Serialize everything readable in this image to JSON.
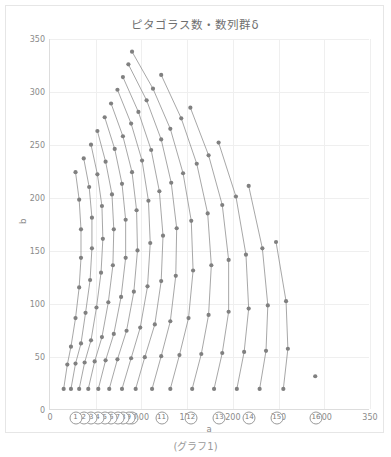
{
  "caption": "(グラフ1)",
  "chart_data": {
    "type": "line",
    "title": "ピタゴラス数・数列群δ",
    "xlabel": "a",
    "ylabel": "b",
    "xlim": [
      0,
      350
    ],
    "ylim": [
      0,
      350
    ],
    "xticks": [
      0,
      50,
      100,
      150,
      200,
      250,
      300,
      350
    ],
    "yticks": [
      0,
      50,
      100,
      150,
      200,
      250,
      300,
      350
    ],
    "grid": true,
    "legend": "none",
    "marker": "circle",
    "marker_color": "#808080",
    "line_color": "#909090",
    "series": [
      {
        "name": "①",
        "label_x": 6,
        "label_y": -13,
        "points": [
          [
            4,
            3
          ],
          [
            5,
            12
          ],
          [
            8,
            15
          ],
          [
            7,
            24
          ],
          [
            12,
            35
          ],
          [
            9,
            40
          ],
          [
            20,
            21
          ],
          [
            12,
            16
          ]
        ]
      },
      {
        "name": "②",
        "label_x": 15,
        "label_y": -13,
        "points": [
          [
            8,
            6
          ],
          [
            10,
            24
          ],
          [
            16,
            30
          ],
          [
            14,
            48
          ],
          [
            24,
            70
          ],
          [
            18,
            80
          ],
          [
            40,
            42
          ],
          [
            24,
            32
          ]
        ]
      },
      {
        "name": "③",
        "label_x": 25,
        "label_y": -13,
        "points": [
          [
            12,
            9
          ],
          [
            15,
            36
          ],
          [
            24,
            45
          ],
          [
            21,
            72
          ],
          [
            36,
            105
          ],
          [
            27,
            120
          ],
          [
            60,
            63
          ],
          [
            36,
            48
          ]
        ]
      },
      {
        "name": "④",
        "label_x": 37,
        "label_y": -13,
        "points": [
          [
            16,
            12
          ],
          [
            20,
            48
          ],
          [
            32,
            60
          ],
          [
            28,
            96
          ],
          [
            48,
            140
          ],
          [
            36,
            160
          ],
          [
            80,
            84
          ],
          [
            48,
            64
          ]
        ]
      },
      {
        "name": "⑤",
        "label_x": 49,
        "label_y": -13,
        "points": [
          [
            20,
            15
          ],
          [
            25,
            60
          ],
          [
            40,
            75
          ],
          [
            35,
            120
          ],
          [
            60,
            175
          ],
          [
            45,
            200
          ],
          [
            100,
            105
          ],
          [
            60,
            80
          ]
        ]
      },
      {
        "name": "⑥",
        "label_x": 64,
        "label_y": -13,
        "points": [
          [
            24,
            18
          ],
          [
            30,
            72
          ],
          [
            48,
            90
          ],
          [
            42,
            144
          ],
          [
            72,
            210
          ],
          [
            54,
            240
          ],
          [
            120,
            126
          ],
          [
            72,
            96
          ]
        ]
      },
      {
        "name": "⑦",
        "label_x": 80,
        "label_y": -13,
        "points": [
          [
            28,
            21
          ],
          [
            35,
            84
          ],
          [
            56,
            105
          ],
          [
            49,
            168
          ],
          [
            84,
            245
          ],
          [
            63,
            280
          ],
          [
            140,
            147
          ],
          [
            84,
            112
          ]
        ]
      },
      {
        "name": "⑧",
        "label_x": 97,
        "label_y": -13,
        "points": [
          [
            32,
            24
          ],
          [
            40,
            96
          ],
          [
            64,
            120
          ],
          [
            56,
            192
          ],
          [
            96,
            280
          ],
          [
            72,
            320
          ],
          [
            160,
            168
          ],
          [
            96,
            128
          ]
        ]
      },
      {
        "name": "⑨",
        "label_x": 116,
        "label_y": -13,
        "points": [
          [
            36,
            27
          ],
          [
            45,
            108
          ],
          [
            72,
            135
          ],
          [
            63,
            216
          ],
          [
            108,
            315
          ],
          [
            81,
            360
          ],
          [
            180,
            189
          ],
          [
            108,
            144
          ]
        ]
      },
      {
        "name": "⑩",
        "label_x": 136,
        "label_y": -13,
        "points": [
          [
            40,
            30
          ],
          [
            50,
            120
          ],
          [
            80,
            150
          ],
          [
            70,
            240
          ],
          [
            120,
            350
          ],
          [
            200,
            210
          ],
          [
            120,
            160
          ]
        ]
      },
      {
        "name": "⑪",
        "label_x": 156,
        "label_y": -13,
        "points": [
          [
            44,
            33
          ],
          [
            55,
            132
          ],
          [
            88,
            165
          ],
          [
            77,
            264
          ],
          [
            220,
            231
          ],
          [
            132,
            176
          ]
        ]
      },
      {
        "name": "⑫",
        "label_x": 178,
        "label_y": -13,
        "points": [
          [
            48,
            36
          ],
          [
            60,
            144
          ],
          [
            96,
            180
          ],
          [
            84,
            288
          ],
          [
            240,
            252
          ],
          [
            144,
            192
          ]
        ]
      },
      {
        "name": "⑬",
        "label_x": 200,
        "label_y": -13,
        "points": [
          [
            52,
            39
          ],
          [
            65,
            156
          ],
          [
            104,
            195
          ],
          [
            91,
            312
          ],
          [
            260,
            273
          ],
          [
            156,
            208
          ]
        ]
      },
      {
        "name": "⑭",
        "label_x": 224,
        "label_y": -13,
        "points": [
          [
            56,
            42
          ],
          [
            70,
            168
          ],
          [
            112,
            210
          ],
          [
            98,
            336
          ],
          [
            280,
            294
          ],
          [
            168,
            224
          ]
        ]
      },
      {
        "name": "⑮",
        "label_x": 249,
        "label_y": -13,
        "points": [
          [
            60,
            45
          ],
          [
            75,
            180
          ],
          [
            120,
            225
          ],
          [
            300,
            315
          ],
          [
            180,
            240
          ]
        ]
      },
      {
        "name": "⑯",
        "label_x": 277,
        "label_y": -13,
        "points": [
          [
            64,
            48
          ],
          [
            80,
            192
          ],
          [
            128,
            240
          ],
          [
            320,
            336
          ],
          [
            192,
            256
          ]
        ]
      }
    ],
    "curves": [
      {
        "name": "⑯",
        "points": [
          [
            291,
            31
          ]
        ]
      },
      {
        "name": "⑮",
        "points": [
          [
            256,
            19
          ],
          [
            261,
            57
          ],
          [
            259,
            102
          ],
          [
            248,
            158
          ]
        ]
      },
      {
        "name": "⑭",
        "points": [
          [
            230,
            19
          ],
          [
            237,
            55
          ],
          [
            239,
            98
          ],
          [
            233,
            152
          ],
          [
            218,
            211
          ]
        ]
      },
      {
        "name": "⑬",
        "points": [
          [
            205,
            19
          ],
          [
            213,
            54
          ],
          [
            218,
            95
          ],
          [
            215,
            146
          ],
          [
            204,
            201
          ],
          [
            185,
            252
          ]
        ]
      },
      {
        "name": "⑫",
        "points": [
          [
            180,
            19
          ],
          [
            189,
            53
          ],
          [
            196,
            92
          ],
          [
            196,
            141
          ],
          [
            189,
            193
          ],
          [
            174,
            240
          ],
          [
            154,
            285
          ]
        ]
      },
      {
        "name": "⑪",
        "points": [
          [
            156,
            19
          ],
          [
            166,
            52
          ],
          [
            174,
            89
          ],
          [
            177,
            136
          ],
          [
            173,
            185
          ],
          [
            161,
            232
          ],
          [
            144,
            275
          ],
          [
            122,
            316
          ]
        ]
      },
      {
        "name": "⑩",
        "points": [
          [
            132,
            19
          ],
          [
            142,
            51
          ],
          [
            152,
            86
          ],
          [
            157,
            131
          ],
          [
            155,
            178
          ],
          [
            146,
            223
          ],
          [
            132,
            265
          ],
          [
            113,
            303
          ],
          [
            90,
            338
          ]
        ]
      },
      {
        "name": "⑨",
        "points": [
          [
            112,
            19
          ],
          [
            122,
            50
          ],
          [
            132,
            83
          ],
          [
            138,
            126
          ],
          [
            139,
            171
          ],
          [
            133,
            214
          ],
          [
            122,
            255
          ],
          [
            106,
            292
          ],
          [
            86,
            326
          ]
        ]
      },
      {
        "name": "⑧",
        "points": [
          [
            94,
            19
          ],
          [
            104,
            49
          ],
          [
            115,
            80
          ],
          [
            122,
            121
          ],
          [
            124,
            164
          ],
          [
            120,
            206
          ],
          [
            111,
            245
          ],
          [
            97,
            281
          ],
          [
            80,
            314
          ]
        ]
      },
      {
        "name": "⑦",
        "points": [
          [
            79,
            19
          ],
          [
            89,
            48
          ],
          [
            99,
            77
          ],
          [
            107,
            116
          ],
          [
            110,
            157
          ],
          [
            108,
            197
          ],
          [
            101,
            235
          ],
          [
            89,
            270
          ],
          [
            74,
            302
          ]
        ]
      },
      {
        "name": "⑥",
        "points": [
          [
            65,
            19
          ],
          [
            74,
            47
          ],
          [
            84,
            74
          ],
          [
            92,
            111
          ],
          [
            96,
            150
          ],
          [
            95,
            188
          ],
          [
            90,
            224
          ],
          [
            80,
            258
          ],
          [
            67,
            289
          ]
        ]
      },
      {
        "name": "⑤",
        "points": [
          [
            53,
            19
          ],
          [
            61,
            46
          ],
          [
            70,
            71
          ],
          [
            78,
            106
          ],
          [
            83,
            143
          ],
          [
            83,
            179
          ],
          [
            79,
            213
          ],
          [
            71,
            246
          ],
          [
            60,
            276
          ]
        ]
      },
      {
        "name": "④",
        "points": [
          [
            42,
            19
          ],
          [
            49,
            45
          ],
          [
            57,
            68
          ],
          [
            64,
            101
          ],
          [
            69,
            136
          ],
          [
            70,
            170
          ],
          [
            68,
            203
          ],
          [
            61,
            234
          ],
          [
            52,
            263
          ]
        ]
      },
      {
        "name": "③",
        "points": [
          [
            32,
            19
          ],
          [
            38,
            44
          ],
          [
            45,
            65
          ],
          [
            51,
            96
          ],
          [
            56,
            129
          ],
          [
            58,
            161
          ],
          [
            57,
            192
          ],
          [
            52,
            222
          ],
          [
            45,
            250
          ]
        ]
      },
      {
        "name": "②",
        "points": [
          [
            23,
            19
          ],
          [
            28,
            43
          ],
          [
            34,
            62
          ],
          [
            39,
            91
          ],
          [
            44,
            122
          ],
          [
            46,
            152
          ],
          [
            46,
            181
          ],
          [
            43,
            210
          ],
          [
            37,
            237
          ]
        ]
      },
      {
        "name": "①",
        "points": [
          [
            15,
            19
          ],
          [
            19,
            42
          ],
          [
            23,
            59
          ],
          [
            28,
            86
          ],
          [
            32,
            115
          ],
          [
            34,
            143
          ],
          [
            34,
            170
          ],
          [
            32,
            198
          ],
          [
            28,
            224
          ]
        ]
      }
    ]
  }
}
